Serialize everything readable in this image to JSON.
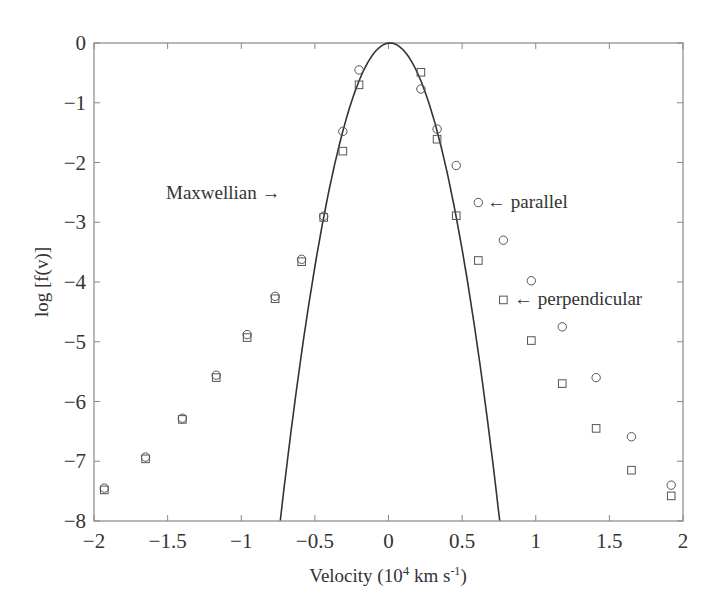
{
  "chart_data": {
    "type": "scatter",
    "title": "",
    "xlabel": "Velocity (10⁴ km s⁻¹)",
    "xlabel_parts": {
      "pre": "Velocity (10",
      "sup1": "4",
      "mid": " km s",
      "sup2": "-1",
      "post": ")"
    },
    "ylabel": "log [f(v)]",
    "xlim": [
      -2,
      2
    ],
    "ylim": [
      -8,
      0
    ],
    "xticks": [
      -2,
      -1.5,
      -1,
      -0.5,
      0,
      0.5,
      1,
      1.5,
      2
    ],
    "xtick_labels": [
      "−2",
      "−1.5",
      "−1",
      "−0.5",
      "0",
      "0.5",
      "1",
      "1.5",
      "2"
    ],
    "yticks": [
      0,
      -1,
      -2,
      -3,
      -4,
      -5,
      -6,
      -7,
      -8
    ],
    "ytick_labels": [
      "0",
      "−1",
      "−2",
      "−3",
      "−4",
      "−5",
      "−6",
      "−7",
      "−8"
    ],
    "grid": false,
    "legend": null,
    "series": [
      {
        "name": "parallel",
        "marker": "circle",
        "x": [
          -1.93,
          -1.65,
          -1.4,
          -1.17,
          -0.96,
          -0.77,
          -0.59,
          -0.44,
          -0.31,
          -0.2,
          0.22,
          0.33,
          0.46,
          0.61,
          0.78,
          0.97,
          1.18,
          1.41,
          1.65,
          1.92
        ],
        "y": [
          -7.45,
          -6.93,
          -6.28,
          -5.56,
          -4.88,
          -4.24,
          -3.62,
          -2.9,
          -1.48,
          -0.45,
          -0.77,
          -1.44,
          -2.05,
          -2.67,
          -3.3,
          -3.98,
          -4.75,
          -5.6,
          -6.59,
          -7.4
        ]
      },
      {
        "name": "perpendicular",
        "marker": "square",
        "x": [
          -1.93,
          -1.65,
          -1.4,
          -1.17,
          -0.96,
          -0.77,
          -0.59,
          -0.44,
          -0.31,
          -0.2,
          0.22,
          0.33,
          0.46,
          0.61,
          0.78,
          0.97,
          1.18,
          1.41,
          1.65,
          1.92
        ],
        "y": [
          -7.48,
          -6.96,
          -6.3,
          -5.6,
          -4.93,
          -4.28,
          -3.66,
          -2.92,
          -1.81,
          -0.7,
          -0.49,
          -1.61,
          -2.89,
          -3.64,
          -4.3,
          -4.98,
          -5.7,
          -6.45,
          -7.15,
          -7.58
        ]
      },
      {
        "name": "Maxwellian",
        "marker": "line",
        "formula": "y = -14.4 * (v - 0.01)^2",
        "x": [
          -0.74,
          -0.6,
          -0.5,
          -0.4,
          -0.3,
          -0.2,
          -0.1,
          0,
          0.1,
          0.2,
          0.3,
          0.4,
          0.5,
          0.6,
          0.75
        ],
        "y": [
          -8.0,
          -5.36,
          -3.75,
          -2.42,
          -1.38,
          -0.64,
          -0.17,
          0,
          -0.12,
          -0.52,
          -1.21,
          -2.19,
          -3.46,
          -5.01,
          -8.0
        ]
      }
    ],
    "annotations": [
      {
        "text": "Maxwellian →",
        "x": -1.51,
        "y": -2.5
      },
      {
        "text": "←  parallel",
        "x": 0.68,
        "y": -2.67
      },
      {
        "text": "←  perpendicular",
        "x": 0.86,
        "y": -4.3
      }
    ]
  },
  "labels": {
    "maxwellian": "Maxwellian →",
    "parallel": "←  parallel",
    "perpendicular": "←  perpendicular"
  }
}
